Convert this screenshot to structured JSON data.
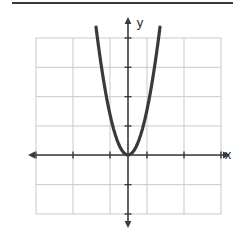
{
  "figure": {
    "title": "",
    "x_axis_label": "x",
    "y_axis_label": "y",
    "grid_color": "#c9c9c9",
    "axis_color": "#3a3a3a",
    "curve_color": "#3a3a3a",
    "background_color": "#ffffff",
    "rule_color": "#3a3a3a"
  },
  "chart_data": {
    "type": "line",
    "title": "",
    "subtitle": "",
    "xlabel": "x",
    "ylabel": "y",
    "xlim": [
      -2.45,
      2.45
    ],
    "ylim": [
      -2.35,
      4.0
    ],
    "grid": true,
    "grid_spacing_x": 1,
    "grid_spacing_y": 1,
    "legend": null,
    "legend_position": "none",
    "annotations": [],
    "tick_labels_x": [],
    "tick_labels_y": [],
    "series": [
      {
        "name": "parabola",
        "equation": "y = 4x^2",
        "vertex": [
          0,
          0
        ],
        "opens": "up",
        "x": [
          -1.0,
          -0.95,
          -0.9,
          -0.85,
          -0.8,
          -0.75,
          -0.7,
          -0.65,
          -0.6,
          -0.55,
          -0.5,
          -0.45,
          -0.4,
          -0.35,
          -0.3,
          -0.25,
          -0.2,
          -0.15,
          -0.1,
          -0.05,
          0.0,
          0.05,
          0.1,
          0.15,
          0.2,
          0.25,
          0.3,
          0.35,
          0.4,
          0.45,
          0.5,
          0.55,
          0.6,
          0.65,
          0.7,
          0.75,
          0.8,
          0.85,
          0.9,
          0.95,
          1.0
        ],
        "y": [
          4.0,
          3.61,
          3.24,
          2.89,
          2.56,
          2.25,
          1.96,
          1.69,
          1.44,
          1.21,
          1.0,
          0.81,
          0.64,
          0.49,
          0.36,
          0.25,
          0.16,
          0.09,
          0.04,
          0.01,
          0.0,
          0.01,
          0.04,
          0.09,
          0.16,
          0.25,
          0.36,
          0.49,
          0.64,
          0.81,
          1.0,
          1.21,
          1.44,
          1.69,
          1.96,
          2.25,
          2.56,
          2.89,
          3.24,
          3.61,
          4.0
        ]
      }
    ]
  },
  "geometry": {
    "grid_left": 36,
    "grid_right": 221,
    "grid_top": 38,
    "grid_bottom": 214,
    "origin_x": 128,
    "origin_y": 155,
    "cell_w": 37,
    "cell_h": 29.33,
    "x_axis_start": 28,
    "x_axis_end": 230,
    "y_axis_start": 17,
    "y_axis_end": 228
  }
}
